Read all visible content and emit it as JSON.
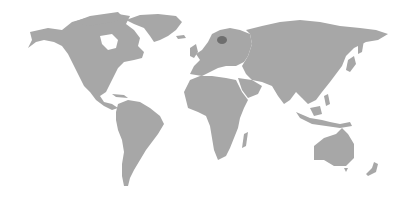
{
  "map": {
    "type": "world-map",
    "projection": "miller-like",
    "background_color": "#ffffff",
    "land_color": "#a7a7a7",
    "highlight_color": "#6e6e6e",
    "highlighted_regions": [
      {
        "name": "Estonia",
        "approx_center_px": [
          222,
          40
        ]
      }
    ],
    "continents": [
      "North America",
      "Greenland",
      "South America",
      "Europe",
      "Africa",
      "Asia",
      "Australia",
      "New Zealand"
    ]
  }
}
